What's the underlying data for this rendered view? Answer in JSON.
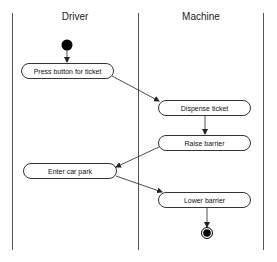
{
  "diagram": {
    "type": "UML activity diagram with swimlanes",
    "lanes": [
      {
        "id": "driver",
        "title": "Driver"
      },
      {
        "id": "machine",
        "title": "Machine"
      }
    ],
    "nodes": {
      "start": {
        "kind": "initial"
      },
      "press_button": {
        "label": "Press button for ticket",
        "lane": "driver"
      },
      "dispense_ticket": {
        "label": "Dispense ticket",
        "lane": "machine"
      },
      "raise_barrier": {
        "label": "Raise barrier",
        "lane": "machine"
      },
      "enter_car_park": {
        "label": "Enter car park",
        "lane": "driver"
      },
      "lower_barrier": {
        "label": "Lower barrier",
        "lane": "machine"
      },
      "end": {
        "kind": "final"
      }
    },
    "edges": [
      {
        "from": "start",
        "to": "press_button"
      },
      {
        "from": "press_button",
        "to": "dispense_ticket"
      },
      {
        "from": "dispense_ticket",
        "to": "raise_barrier"
      },
      {
        "from": "raise_barrier",
        "to": "enter_car_park"
      },
      {
        "from": "enter_car_park",
        "to": "lower_barrier"
      },
      {
        "from": "lower_barrier",
        "to": "end"
      }
    ],
    "colors": {
      "line": "#333333",
      "node_fill": "#000000",
      "background": "#ffffff"
    }
  }
}
